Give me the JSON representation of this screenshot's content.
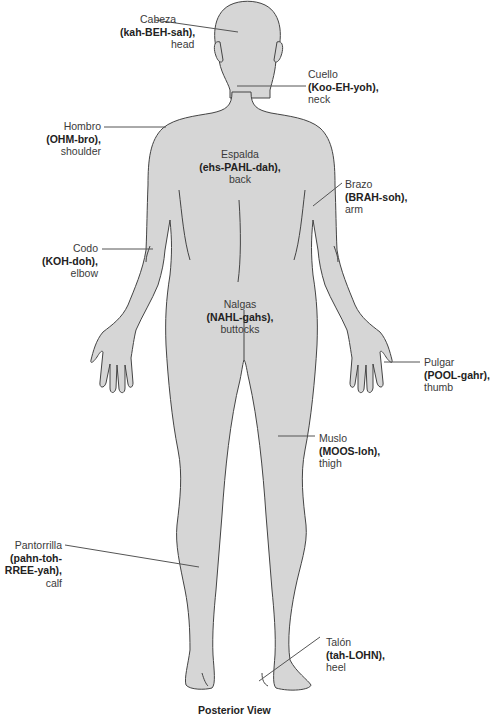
{
  "figure": {
    "caption": "Posterior View",
    "body_fill": "#d6d6d6",
    "outline_color": "#444444",
    "leader_color": "#555555"
  },
  "labels": {
    "cabeza": {
      "term": "Cabeza",
      "pron": "(kah-BEH-sah),",
      "eng": "head"
    },
    "cuello": {
      "term": "Cuello",
      "pron": "(Koo-EH-yoh),",
      "eng": "neck"
    },
    "hombro": {
      "term": "Hombro",
      "pron": "(OHM-bro),",
      "eng": "shoulder"
    },
    "espalda": {
      "term": "Espalda",
      "pron": "(ehs-PAHL-dah),",
      "eng": "back"
    },
    "brazo": {
      "term": "Brazo",
      "pron": "(BRAH-soh),",
      "eng": "arm"
    },
    "codo": {
      "term": "Codo",
      "pron": "(KOH-doh),",
      "eng": "elbow"
    },
    "nalgas": {
      "term": "Nalgas",
      "pron": "(NAHL-gahs),",
      "eng": "buttocks"
    },
    "pulgar": {
      "term": "Pulgar",
      "pron": "(POOL-gahr),",
      "eng": "thumb"
    },
    "muslo": {
      "term": "Muslo",
      "pron": "(MOOS-loh),",
      "eng": "thigh"
    },
    "pantorrilla": {
      "term": "Pantorrilla",
      "pron1": "(pahn-toh-",
      "pron2": "RREE-yah),",
      "eng": "calf"
    },
    "talon": {
      "term": "Talón",
      "pron": "(tah-LOHN),",
      "eng": "heel"
    }
  }
}
